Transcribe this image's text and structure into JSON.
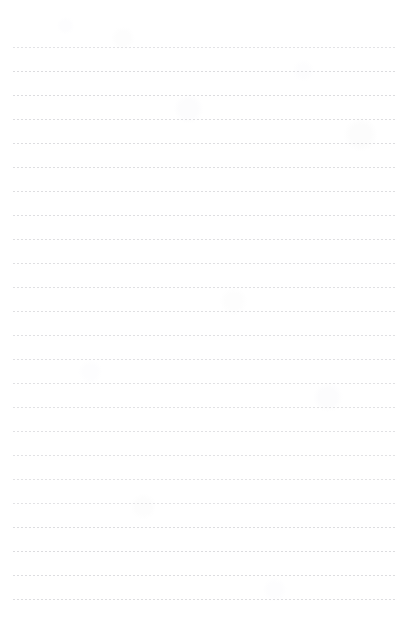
{
  "document": {
    "kind": "lined-paper-sheet",
    "description": "Blank dotted-rule writing paper scan",
    "has_text_content": false,
    "body_text": ""
  },
  "page": {
    "width": 410,
    "height": 641,
    "background_color": "#ffffff"
  },
  "rules": {
    "count": 24,
    "first_line_y": 47,
    "line_spacing": 24,
    "left_x": 13,
    "right_x": 396,
    "thickness": 1,
    "color": "#dcdcdf",
    "style": "dotted",
    "dot_pitch": 4,
    "dot_length": 2,
    "lines_y": [
      47,
      71,
      95,
      119,
      143,
      167,
      191,
      215,
      239,
      263,
      287,
      311,
      335,
      359,
      383,
      407,
      431,
      455,
      479,
      503,
      527,
      551,
      575,
      599
    ]
  },
  "margins": {
    "top": 47,
    "bottom": 27,
    "left": 13,
    "right": 14
  }
}
